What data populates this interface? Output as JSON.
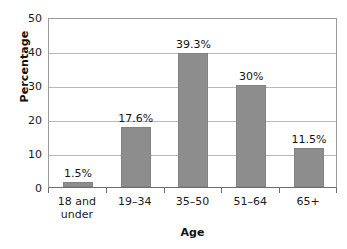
{
  "chart_data": {
    "type": "bar",
    "title": "",
    "subtitle": "",
    "xlabel": "Age",
    "ylabel": "Percentage",
    "categories": [
      "18 and under",
      "19–34",
      "35–50",
      "51–64",
      "65+"
    ],
    "values": [
      1.5,
      17.6,
      39.3,
      30,
      11.5
    ],
    "data_labels": [
      "1.5%",
      "17.6%",
      "39.3%",
      "30%",
      "11.5%"
    ],
    "ylim": [
      0,
      50
    ],
    "yticks": [
      0,
      10,
      20,
      30,
      40,
      50
    ],
    "ytick_labels": [
      "0",
      "10",
      "20",
      "30",
      "40",
      "50"
    ],
    "grid": true,
    "grid_axis": "y",
    "legend": false,
    "legend_position": "none",
    "bar_color": "#8d8d8d",
    "grid_color": "#b9b9b9",
    "axis_color": "#6e6e6e",
    "background_color": "#ffffff",
    "text_color": "#1a1a1a"
  },
  "axes": {
    "y_title": "Percentage",
    "x_title": "Age"
  },
  "category_label_lines": [
    [
      "18 and",
      "under"
    ],
    [
      "19–34"
    ],
    [
      "35–50"
    ],
    [
      "51–64"
    ],
    [
      "65+"
    ]
  ]
}
